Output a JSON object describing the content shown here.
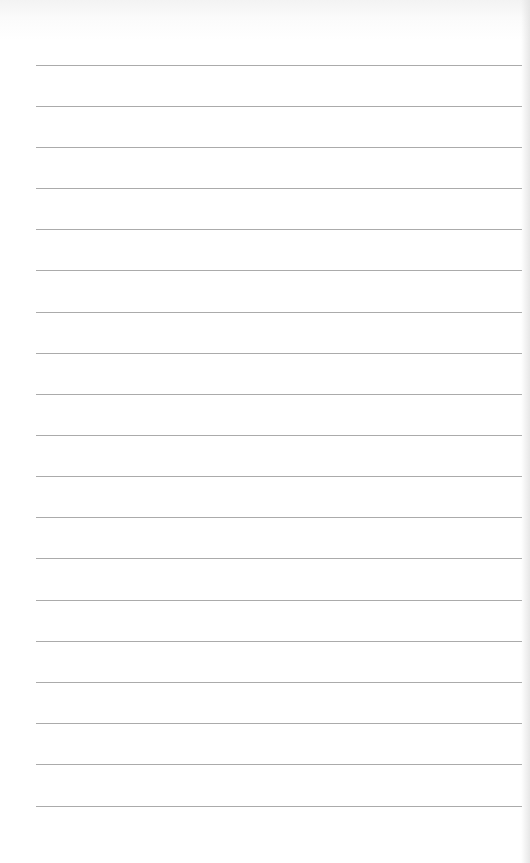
{
  "page": {
    "type": "lined-paper",
    "background_color": "#ffffff",
    "rule_color": "#9c9c9c",
    "rule_count": 19,
    "rule_left": 36,
    "rule_right": 522,
    "rule_first_y": 65,
    "rule_spacing": 41.16
  },
  "rules": [
    {
      "y": 65
    },
    {
      "y": 106
    },
    {
      "y": 147
    },
    {
      "y": 188
    },
    {
      "y": 229
    },
    {
      "y": 270
    },
    {
      "y": 312
    },
    {
      "y": 353
    },
    {
      "y": 394
    },
    {
      "y": 435
    },
    {
      "y": 476
    },
    {
      "y": 517
    },
    {
      "y": 558
    },
    {
      "y": 600
    },
    {
      "y": 641
    },
    {
      "y": 682
    },
    {
      "y": 723
    },
    {
      "y": 764
    },
    {
      "y": 806
    }
  ]
}
